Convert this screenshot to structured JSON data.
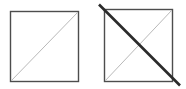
{
  "figure": {
    "title": "Two squares with diagonals",
    "canvas": {
      "width": 186,
      "height": 89,
      "background": "#ffffff"
    },
    "colors": {
      "square_border": "#4d4d4d",
      "thin_diagonal": "#b9b9b9",
      "thick_diagonal": "#2b2b2b"
    },
    "stroke_widths": {
      "square_border": 1.4,
      "thin_diagonal": 1.0,
      "thick_diagonal": 2.6
    },
    "shapes": [
      {
        "name": "left-square",
        "kind": "square",
        "x": 10.5,
        "y": 11.5,
        "width": 68,
        "height": 70,
        "label": "Square 1"
      },
      {
        "name": "right-square",
        "kind": "square",
        "x": 104.5,
        "y": 9.5,
        "width": 68,
        "height": 72,
        "label": "Square 2"
      }
    ],
    "lines": [
      {
        "name": "left-square-diagonal",
        "style": "thin-light",
        "x1": 11,
        "y1": 81,
        "x2": 78,
        "y2": 12,
        "direction": "bottom-left-to-top-right"
      },
      {
        "name": "right-square-diagonal-rising",
        "style": "thin-light",
        "x1": 105,
        "y1": 81,
        "x2": 172,
        "y2": 10,
        "direction": "bottom-left-to-top-right"
      },
      {
        "name": "right-square-diagonal-falling",
        "style": "thick-dark",
        "x1": 99,
        "y1": 4.5,
        "x2": 180,
        "y2": 85.5,
        "direction": "top-left-to-bottom-right-overshoot"
      }
    ]
  }
}
